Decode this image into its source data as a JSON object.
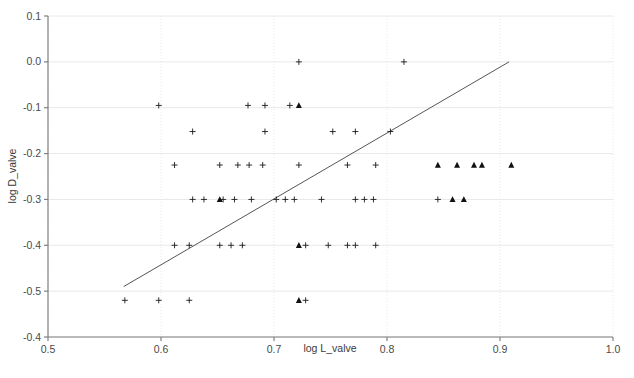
{
  "figure": {
    "background_color": "#ffffff",
    "axis_color": "#808080",
    "grid_color": "#e8e8e8",
    "marker_color": "#1a1a1a",
    "line_color": "#555555",
    "caption_partial": ""
  },
  "chart_data": {
    "type": "scatter",
    "title": "",
    "xlabel": "log L_valve",
    "ylabel": "log D_valve",
    "xlim": [
      0.5,
      1.0
    ],
    "ylim": [
      -0.6,
      0.1
    ],
    "xticks": [
      0.5,
      0.6,
      0.7,
      0.8,
      0.9,
      1.0
    ],
    "xtick_labels": [
      "0.5",
      "0.6",
      "0.7",
      "0.8",
      "0.9",
      "1.0"
    ],
    "yticks": [
      0.1,
      0.0,
      -0.1,
      -0.2,
      -0.3,
      -0.4,
      -0.5,
      -0.6
    ],
    "ytick_labels": [
      "0.1",
      "0.0",
      "-0.1",
      "-0.2",
      "-0.3",
      "-0.4",
      "-0.5",
      "-0.4"
    ],
    "grid": true,
    "legend": "none",
    "series": [
      {
        "name": "plus-markers",
        "marker": "plus",
        "color": "#1a1a1a",
        "points": [
          [
            0.722,
            0.0
          ],
          [
            0.815,
            0.0
          ],
          [
            0.598,
            -0.095
          ],
          [
            0.677,
            -0.095
          ],
          [
            0.692,
            -0.095
          ],
          [
            0.714,
            -0.095
          ],
          [
            0.628,
            -0.152
          ],
          [
            0.692,
            -0.152
          ],
          [
            0.752,
            -0.152
          ],
          [
            0.772,
            -0.152
          ],
          [
            0.803,
            -0.152
          ],
          [
            0.612,
            -0.225
          ],
          [
            0.652,
            -0.225
          ],
          [
            0.668,
            -0.225
          ],
          [
            0.678,
            -0.225
          ],
          [
            0.69,
            -0.225
          ],
          [
            0.722,
            -0.225
          ],
          [
            0.765,
            -0.225
          ],
          [
            0.79,
            -0.225
          ],
          [
            0.628,
            -0.3
          ],
          [
            0.638,
            -0.3
          ],
          [
            0.655,
            -0.3
          ],
          [
            0.665,
            -0.3
          ],
          [
            0.68,
            -0.3
          ],
          [
            0.702,
            -0.3
          ],
          [
            0.71,
            -0.3
          ],
          [
            0.718,
            -0.3
          ],
          [
            0.742,
            -0.3
          ],
          [
            0.772,
            -0.3
          ],
          [
            0.78,
            -0.3
          ],
          [
            0.788,
            -0.3
          ],
          [
            0.845,
            -0.3
          ],
          [
            0.612,
            -0.4
          ],
          [
            0.625,
            -0.4
          ],
          [
            0.652,
            -0.4
          ],
          [
            0.662,
            -0.4
          ],
          [
            0.672,
            -0.4
          ],
          [
            0.728,
            -0.4
          ],
          [
            0.748,
            -0.4
          ],
          [
            0.765,
            -0.4
          ],
          [
            0.772,
            -0.4
          ],
          [
            0.79,
            -0.4
          ],
          [
            0.568,
            -0.52
          ],
          [
            0.598,
            -0.52
          ],
          [
            0.625,
            -0.52
          ],
          [
            0.728,
            -0.52
          ]
        ]
      },
      {
        "name": "triangle-markers",
        "marker": "triangle",
        "color": "#111111",
        "points": [
          [
            0.722,
            -0.095
          ],
          [
            0.845,
            -0.225
          ],
          [
            0.862,
            -0.225
          ],
          [
            0.877,
            -0.225
          ],
          [
            0.884,
            -0.225
          ],
          [
            0.91,
            -0.225
          ],
          [
            0.652,
            -0.3
          ],
          [
            0.858,
            -0.3
          ],
          [
            0.868,
            -0.3
          ],
          [
            0.722,
            -0.4
          ],
          [
            0.722,
            -0.52
          ]
        ]
      }
    ],
    "fit_line": {
      "name": "regression-line",
      "color": "#555555",
      "x_start": 0.567,
      "y_start": -0.49,
      "x_end": 0.908,
      "y_end": 0.0
    }
  }
}
